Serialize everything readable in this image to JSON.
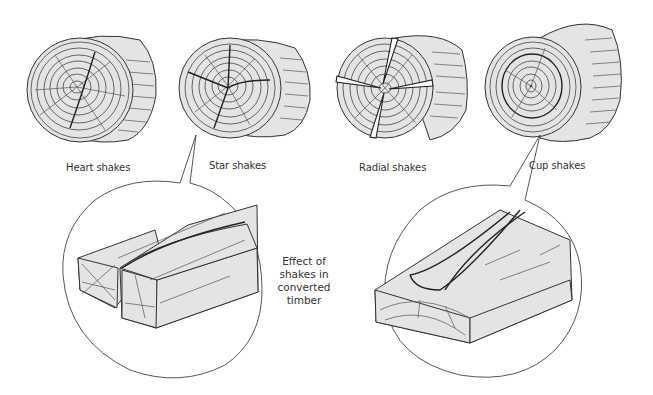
{
  "figure": {
    "colors": {
      "wood_fill": "#e4e4e4",
      "line": "#333333",
      "background": "#ffffff"
    },
    "logs": [
      {
        "id": "heart",
        "label": "Heart shakes"
      },
      {
        "id": "star",
        "label": "Star shakes"
      },
      {
        "id": "radial",
        "label": "Radial shakes"
      },
      {
        "id": "cup",
        "label": "Cup shakes"
      }
    ],
    "details": [
      {
        "id": "star-detail",
        "source": "Star shakes",
        "description": "Converted timber section with star shake split"
      },
      {
        "id": "cup-detail",
        "source": "Cup shakes",
        "description": "Converted timber section with cup shake separation"
      }
    ],
    "caption_lines": [
      "Effect of",
      "shakes in",
      "converted",
      "timber"
    ]
  }
}
